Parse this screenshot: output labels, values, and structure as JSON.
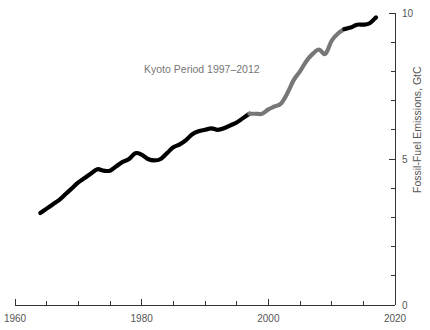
{
  "chart_data": {
    "type": "line",
    "title": "",
    "subtitle": "",
    "xlabel": "",
    "ylabel": "Fossil-Fuel Emissions, GtC",
    "xlim": [
      1960,
      2020
    ],
    "ylim": [
      0,
      10
    ],
    "grid": false,
    "legend_position": "none",
    "x_ticks_major": [
      1960,
      1980,
      2000,
      2020
    ],
    "x_tick_labels": [
      "1960",
      "1980",
      "2000",
      "2020"
    ],
    "x_ticks_minor": [
      1965,
      1970,
      1975,
      1985,
      1990,
      1995,
      2005,
      2010,
      2015
    ],
    "y_ticks_major": [
      0,
      5,
      10
    ],
    "y_tick_labels": [
      "0",
      "5",
      "10"
    ],
    "y_ticks_minor": [
      1,
      2,
      3,
      4,
      6,
      7,
      8,
      9
    ],
    "y_axis_side": "right",
    "annotations": [
      {
        "text": "Kyoto Period 1997–2012",
        "x": 1989.5,
        "y": 7.95,
        "color": "#777777"
      }
    ],
    "series": [
      {
        "name": "Fossil-Fuel Emissions",
        "color_pre_kyoto": "#000000",
        "color_kyoto": "#777777",
        "color_post_kyoto": "#000000",
        "kyoto_start": 1997,
        "kyoto_end": 2012,
        "x": [
          1964,
          1965,
          1966,
          1967,
          1968,
          1969,
          1970,
          1971,
          1972,
          1973,
          1974,
          1975,
          1976,
          1977,
          1978,
          1979,
          1980,
          1981,
          1982,
          1983,
          1984,
          1985,
          1986,
          1987,
          1988,
          1989,
          1990,
          1991,
          1992,
          1993,
          1994,
          1995,
          1996,
          1997,
          1998,
          1999,
          2000,
          2001,
          2002,
          2003,
          2004,
          2005,
          2006,
          2007,
          2008,
          2009,
          2010,
          2011,
          2012,
          2013,
          2014,
          2015,
          2016,
          2017
        ],
        "y": [
          3.15,
          3.3,
          3.45,
          3.6,
          3.8,
          4.0,
          4.2,
          4.35,
          4.5,
          4.65,
          4.6,
          4.6,
          4.75,
          4.9,
          5.0,
          5.2,
          5.15,
          5.0,
          4.95,
          5.0,
          5.2,
          5.4,
          5.5,
          5.65,
          5.85,
          5.95,
          6.0,
          6.05,
          6.0,
          6.05,
          6.15,
          6.25,
          6.4,
          6.55,
          6.55,
          6.55,
          6.7,
          6.8,
          6.9,
          7.25,
          7.7,
          8.0,
          8.35,
          8.6,
          8.75,
          8.6,
          9.05,
          9.3,
          9.45,
          9.5,
          9.6,
          9.6,
          9.65,
          9.85
        ]
      }
    ]
  },
  "axis_geometry": {
    "plot_left_px": 15,
    "plot_right_px": 395,
    "plot_top_px": 13,
    "plot_bottom_px": 305
  }
}
